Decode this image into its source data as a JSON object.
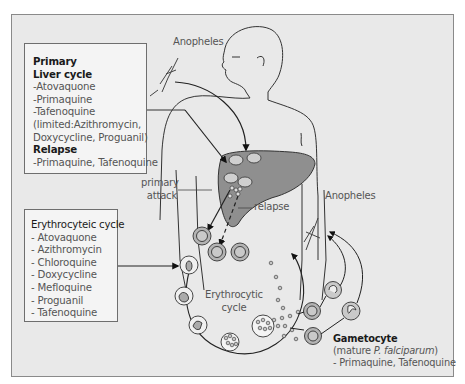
{
  "diagram": {
    "type": "malaria-life-cycle-drug-targets",
    "colors": {
      "panel_background": "#e9e9e9",
      "panel_border": "#8a8a8a",
      "box_background": "#f4f4f4",
      "box_border": "#6e6e6e",
      "liver_fill": "#8f8f8f",
      "cell_fill": "#b3b3b3",
      "line": "#222222"
    },
    "liver_box": {
      "heading_primary": "Primary",
      "heading_liver": "Liver cycle",
      "items": [
        "-Atovaquone",
        "-Primaquine",
        "-Tafenoquine",
        "(limited:Azithromycin,",
        "Doxycycline, Proguanil)"
      ],
      "heading_relapse": "Relapse",
      "relapse_items": [
        "-Primaquine, Tafenoquine"
      ]
    },
    "erythrocytic_box": {
      "heading": "Erythrocyteic cycle",
      "items": [
        "- Atovaquone",
        "- Azithromycin",
        "- Chloroquine",
        "- Doxycycline",
        "- Mefloquine",
        "- Proguanil",
        "- Tafenoquine"
      ]
    },
    "labels": {
      "anopheles_top": "Anopheles",
      "anopheles_right": "Anopheles",
      "primary_attack_1": "primary",
      "primary_attack_2": "attack",
      "relapse": "relapse",
      "erythrocytic_cycle_1": "Erythrocytic",
      "erythrocytic_cycle_2": "cycle"
    },
    "gametocyte": {
      "heading": "Gametocyte",
      "subtitle_prefix": "(mature ",
      "subtitle_species": "P. falciparum",
      "subtitle_suffix": ")",
      "drugs": "- Primaquine, Tafenoquine"
    }
  }
}
